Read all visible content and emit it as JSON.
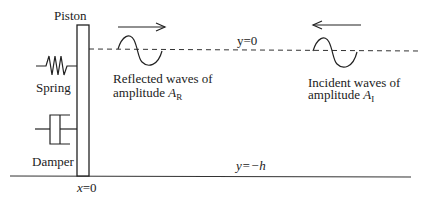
{
  "diagram": {
    "type": "wavemaker-piston-schematic",
    "labels": {
      "piston": "Piston",
      "spring": "Spring",
      "damper": "Damper",
      "surface": "y=0",
      "bottom": "y=−h",
      "origin_var": "x",
      "origin_eq": "=0",
      "reflected_line1": "Reflected waves of",
      "reflected_line2": "amplitude ",
      "reflected_symbol": "A",
      "reflected_sub": "R",
      "incident_line1": "Incident waves of",
      "incident_line2": "amplitude ",
      "incident_symbol": "A",
      "incident_sub": "I"
    },
    "arrows": {
      "reflected_direction": "right",
      "incident_direction": "left"
    },
    "colors": {
      "stroke": "#222222",
      "background": "#ffffff"
    }
  }
}
